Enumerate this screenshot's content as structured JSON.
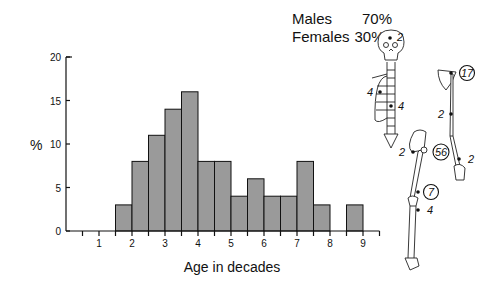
{
  "legend": {
    "males_label": "Males",
    "males_value": "70%",
    "females_label": "Females",
    "females_value": "30%"
  },
  "colors": {
    "bar_fill": "#9a9a9a",
    "bar_stroke": "#111111",
    "axis": "#111111"
  },
  "chart_data": {
    "type": "bar",
    "xlabel": "Age in decades",
    "ylabel": "%",
    "ylim": [
      0,
      20
    ],
    "xlim": [
      0,
      10
    ],
    "yticks": [
      0,
      5,
      10,
      15,
      20
    ],
    "xtick_labels": [
      "1",
      "2",
      "3",
      "4",
      "5",
      "6",
      "7",
      "8",
      "9"
    ],
    "grid": false,
    "bins": [
      {
        "start": 1.5,
        "end": 2.0,
        "value": 3
      },
      {
        "start": 2.0,
        "end": 2.5,
        "value": 8
      },
      {
        "start": 2.5,
        "end": 3.0,
        "value": 11
      },
      {
        "start": 3.0,
        "end": 3.5,
        "value": 14
      },
      {
        "start": 3.5,
        "end": 4.0,
        "value": 16
      },
      {
        "start": 4.0,
        "end": 4.5,
        "value": 8
      },
      {
        "start": 4.5,
        "end": 5.0,
        "value": 8
      },
      {
        "start": 5.0,
        "end": 5.5,
        "value": 4
      },
      {
        "start": 5.5,
        "end": 6.0,
        "value": 6
      },
      {
        "start": 6.0,
        "end": 6.5,
        "value": 4
      },
      {
        "start": 6.5,
        "end": 7.0,
        "value": 4
      },
      {
        "start": 7.0,
        "end": 7.5,
        "value": 8
      },
      {
        "start": 7.5,
        "end": 8.0,
        "value": 3
      },
      {
        "start": 8.0,
        "end": 8.5,
        "value": 0
      },
      {
        "start": 8.5,
        "end": 9.0,
        "value": 3
      }
    ]
  },
  "skeleton_annotations": [
    {
      "site": "skull",
      "value": "2",
      "circled": false
    },
    {
      "site": "ribs",
      "value": "4",
      "circled": false
    },
    {
      "site": "spine",
      "value": "4",
      "circled": false
    },
    {
      "site": "proximal-humerus",
      "value": "17",
      "circled": true
    },
    {
      "site": "humerus-shaft",
      "value": "2",
      "circled": false
    },
    {
      "site": "hand",
      "value": "2",
      "circled": false
    },
    {
      "site": "pelvis",
      "value": "2",
      "circled": false
    },
    {
      "site": "proximal-femur",
      "value": "56",
      "circled": true
    },
    {
      "site": "distal-femur",
      "value": "7",
      "circled": true
    },
    {
      "site": "proximal-tibia",
      "value": "4",
      "circled": false
    }
  ]
}
